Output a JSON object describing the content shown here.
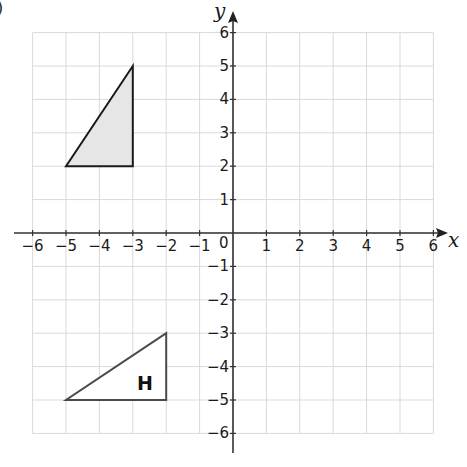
{
  "figure": {
    "corner_mark": ")",
    "axes": {
      "x_label": "x",
      "y_label": "y",
      "origin_label": "0",
      "x_ticks": [
        "−6",
        "−5",
        "−4",
        "−3",
        "−2",
        "−1",
        "1",
        "2",
        "3",
        "4",
        "5",
        "6"
      ],
      "y_ticks": [
        "6",
        "5",
        "4",
        "3",
        "2",
        "1",
        "−1",
        "−2",
        "−3",
        "−4",
        "−5",
        "−6"
      ],
      "xlim": [
        -6,
        6
      ],
      "ylim": [
        -6,
        6
      ]
    },
    "shapes": [
      {
        "name": "shaded-triangle",
        "label": "",
        "vertices": [
          [
            -5,
            2
          ],
          [
            -3,
            2
          ],
          [
            -3,
            5
          ]
        ],
        "fill": "#e6e6e6",
        "stroke": "#1a1a1a"
      },
      {
        "name": "triangle-H",
        "label": "H",
        "vertices": [
          [
            -5,
            -5
          ],
          [
            -2,
            -5
          ],
          [
            -2,
            -3
          ]
        ],
        "fill": "#ffffff",
        "stroke": "#4a4a4a"
      }
    ],
    "colors": {
      "grid": "#d9d9d9",
      "axis": "#333333"
    }
  }
}
